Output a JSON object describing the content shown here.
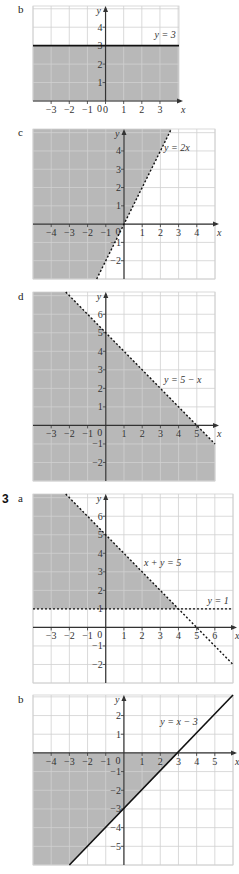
{
  "colors": {
    "shade": "#b8b8b8",
    "grid": "#d0d0d0",
    "axis": "#333333",
    "line": "#111111"
  },
  "labels": {
    "b1": "b",
    "c": "c",
    "d": "d",
    "q3": "3",
    "a": "a",
    "b2": "b"
  },
  "chart_data": [
    {
      "id": "b1",
      "type": "area",
      "title": "y = 3",
      "box": [
        33,
        6,
        179,
        101
      ],
      "xlim": [
        -4,
        4.05
      ],
      "ylim": [
        0,
        5.15
      ],
      "xticks": [
        -3,
        -2,
        -1,
        0,
        1,
        2,
        3
      ],
      "yticks": [
        1,
        2,
        3,
        4
      ],
      "lines": [
        {
          "eq": "y = 3",
          "points": [
            [
              -4,
              3
            ],
            [
              4.05,
              3
            ]
          ],
          "style": "solid"
        }
      ],
      "shade": [
        [
          -4,
          0
        ],
        [
          -4,
          3
        ],
        [
          4.05,
          3
        ],
        [
          4.05,
          0
        ]
      ],
      "label_pos": [
        2.7,
        3.4
      ]
    },
    {
      "id": "c",
      "type": "area",
      "title": "y = 2x",
      "box": [
        33,
        129,
        215,
        279
      ],
      "xlim": [
        -5,
        5
      ],
      "ylim": [
        -3,
        5.2
      ],
      "xticks": [
        -4,
        -3,
        -2,
        -1,
        1,
        2,
        3,
        4
      ],
      "yticks": [
        -2,
        -1,
        1,
        2,
        3,
        4
      ],
      "lines": [
        {
          "eq": "y = 2x",
          "points": [
            [
              -1.5,
              -3
            ],
            [
              2.6,
              5.2
            ]
          ],
          "style": "dashed"
        }
      ],
      "shade": [
        [
          -5,
          -3
        ],
        [
          -5,
          5.2
        ],
        [
          2.6,
          5.2
        ],
        [
          -1.5,
          -3
        ]
      ],
      "label_pos": [
        2.2,
        4
      ]
    },
    {
      "id": "d",
      "type": "area",
      "title": "y = 5 − x",
      "box": [
        33,
        292,
        215,
        481
      ],
      "xlim": [
        -4,
        6
      ],
      "ylim": [
        -3,
        7.2
      ],
      "xticks": [
        -3,
        -2,
        -1,
        1,
        2,
        3,
        4,
        5
      ],
      "yticks": [
        -2,
        -1,
        1,
        2,
        3,
        4,
        5,
        6
      ],
      "lines": [
        {
          "eq": "y = 5 − x",
          "points": [
            [
              -2.2,
              7.2
            ],
            [
              6,
              -1
            ]
          ],
          "style": "dashed"
        }
      ],
      "shade": [
        [
          -4,
          -3
        ],
        [
          -4,
          7.2
        ],
        [
          -2.2,
          7.2
        ],
        [
          6,
          -1
        ],
        [
          6,
          -3
        ]
      ],
      "label_pos": [
        3.2,
        2.3
      ]
    },
    {
      "id": "3a",
      "type": "area",
      "title": "x + y = 5, y = 1",
      "box": [
        33,
        494,
        233,
        683
      ],
      "xlim": [
        -4,
        7
      ],
      "ylim": [
        -3,
        7.2
      ],
      "xticks": [
        -3,
        -2,
        -1,
        1,
        2,
        3,
        4,
        5,
        6
      ],
      "yticks": [
        -2,
        -1,
        1,
        2,
        3,
        4,
        5,
        6
      ],
      "lines": [
        {
          "eq": "x + y = 5",
          "points": [
            [
              -2.2,
              7.2
            ],
            [
              7,
              -2
            ]
          ],
          "style": "dashed"
        },
        {
          "eq": "y = 1",
          "points": [
            [
              -4,
              1
            ],
            [
              7,
              1
            ]
          ],
          "style": "dashed"
        }
      ],
      "shade": [
        [
          -4,
          1
        ],
        [
          -4,
          7.2
        ],
        [
          -2.2,
          7.2
        ],
        [
          4,
          1
        ]
      ],
      "label_pos": [
        2.1,
        3.3
      ],
      "label_pos2": [
        5.6,
        1.25
      ]
    },
    {
      "id": "3b",
      "type": "area",
      "title": "y = x − 3",
      "box": [
        33,
        695,
        233,
        865
      ],
      "xlim": [
        -5,
        6
      ],
      "ylim": [
        -6,
        3.1
      ],
      "xticks": [
        -4,
        -3,
        -2,
        -1,
        1,
        2,
        3,
        4,
        5
      ],
      "yticks": [
        -5,
        -4,
        -3,
        -2,
        -1,
        1,
        2
      ],
      "lines": [
        {
          "eq": "y = x − 3",
          "points": [
            [
              -3,
              -6
            ],
            [
              6,
              3.1
            ]
          ],
          "style": "solid"
        }
      ],
      "shade": [
        [
          -5,
          0
        ],
        [
          3,
          0
        ],
        [
          -3,
          -6
        ],
        [
          -5,
          -6
        ]
      ],
      "label_pos": [
        2,
        1.5
      ]
    }
  ]
}
